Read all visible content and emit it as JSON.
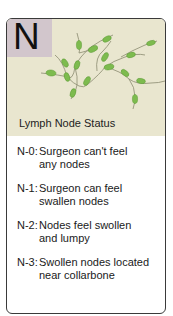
{
  "card": {
    "letter": "N",
    "title": "Lymph Node Status",
    "items": [
      {
        "code": "N-0:",
        "line1": "Surgeon can't feel",
        "line2": "any nodes"
      },
      {
        "code": "N-1:",
        "line1": "Surgeon can feel",
        "line2": "swallen nodes"
      },
      {
        "code": "N-2:",
        "line1": "Nodes feel swollen",
        "line2": "and lumpy"
      },
      {
        "code": "N-3:",
        "line1": "Swollen nodes located",
        "line2": "near collarbone"
      }
    ]
  },
  "colors": {
    "header_bg": "#e9e6cf",
    "letter_box_bg": "#d2c6cc",
    "node_green": "#7dbb4e",
    "vessel": "#8a8a70",
    "border": "#3a3a3a"
  },
  "icons": {
    "illustration": "lymph-node-network-icon"
  }
}
